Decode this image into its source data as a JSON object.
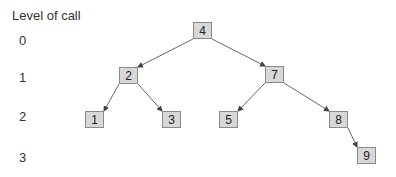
{
  "title": "Level of call",
  "levels": [
    {
      "label": "0",
      "y": 33
    },
    {
      "label": "1",
      "y": 70
    },
    {
      "label": "2",
      "y": 109
    },
    {
      "label": "3",
      "y": 150
    }
  ],
  "colors": {
    "node_fill": "#d8d8d8",
    "node_border": "#8a8a8a",
    "edge": "#444444"
  },
  "nodes": [
    {
      "id": "4",
      "label": "4",
      "x": 193,
      "y": 22,
      "level": 0
    },
    {
      "id": "2",
      "label": "2",
      "x": 119,
      "y": 67,
      "level": 1
    },
    {
      "id": "7",
      "label": "7",
      "x": 265,
      "y": 66,
      "level": 1
    },
    {
      "id": "1",
      "label": "1",
      "x": 85,
      "y": 111,
      "level": 2
    },
    {
      "id": "3",
      "label": "3",
      "x": 162,
      "y": 111,
      "level": 2
    },
    {
      "id": "5",
      "label": "5",
      "x": 219,
      "y": 111,
      "level": 2
    },
    {
      "id": "8",
      "label": "8",
      "x": 329,
      "y": 111,
      "level": 2
    },
    {
      "id": "9",
      "label": "9",
      "x": 357,
      "y": 147,
      "level": 3
    }
  ],
  "edges": [
    {
      "from": "4",
      "to": "2"
    },
    {
      "from": "4",
      "to": "7"
    },
    {
      "from": "2",
      "to": "1"
    },
    {
      "from": "2",
      "to": "3"
    },
    {
      "from": "7",
      "to": "5"
    },
    {
      "from": "7",
      "to": "8"
    },
    {
      "from": "8",
      "to": "9"
    }
  ]
}
